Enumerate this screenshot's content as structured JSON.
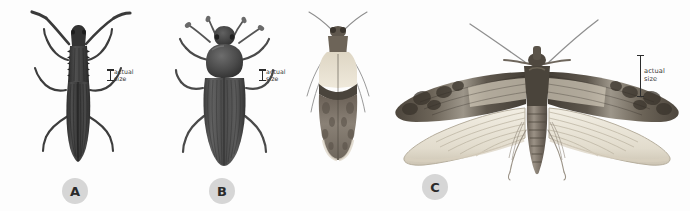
{
  "plate": {
    "background_color": "#fdfdfd",
    "width": 690,
    "height": 211,
    "medium": "grayscale scientific illustration"
  },
  "scale_bars": [
    {
      "id": "scale-a",
      "label": "actual\nsize",
      "for_figure": "A"
    },
    {
      "id": "scale-b",
      "label": "actual\nsize",
      "for_figure": "B"
    },
    {
      "id": "scale-c",
      "label": "actual\nsize",
      "for_figure": "C"
    }
  ],
  "figures": [
    {
      "letter": "A",
      "badge_label": "A",
      "specimen": "sawtoothed-grain-beetle",
      "description": "elongate flattened dark beetle with serrated pronotum margins and longitudinally ridged elytra",
      "body_color": "#3b3b3b"
    },
    {
      "letter": "B",
      "badge_label": "B",
      "specimen": "darkling-beetle",
      "description": "broad oval dark beetle with clubbed antennae and rounded pronotum",
      "body_color": "#4a4a4a"
    },
    {
      "letter": "C",
      "badge_label": "C",
      "specimen": "indianmeal-moth",
      "description": "moth shown twice: at rest with folded wings and with wings spread",
      "forewing_pale_color": "#e8e2d2",
      "forewing_dark_color": "#595146"
    }
  ]
}
